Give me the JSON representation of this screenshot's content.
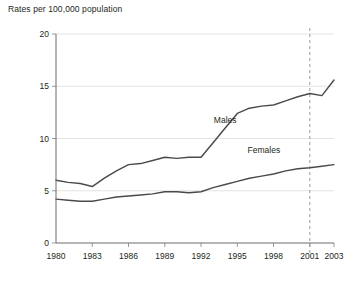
{
  "chart_data": {
    "type": "line",
    "title": "Rates per 100,000 population",
    "xlabel": "",
    "ylabel": "Rates per 100,000 population",
    "xlim": [
      1980,
      2003
    ],
    "ylim": [
      0,
      20
    ],
    "yticks": [
      "0",
      "5",
      "10",
      "15",
      "20"
    ],
    "ytick_values": [
      0,
      5,
      10,
      15,
      20
    ],
    "xticks": [
      "1980",
      "1983",
      "1986",
      "1989",
      "1992",
      "1995",
      "1998",
      "2001",
      "2003"
    ],
    "xtick_values": [
      1980,
      1983,
      1986,
      1989,
      1992,
      1995,
      1998,
      2001,
      2003
    ],
    "grid": true,
    "legend_position": "inline-annotation",
    "annotations": [
      {
        "text": "Males",
        "x": 1994,
        "y": 11.5
      },
      {
        "text": "Females",
        "x": 1997.2,
        "y": 8.6
      }
    ],
    "reference_line": {
      "x": 2001,
      "style": "dashed"
    },
    "x": [
      1980,
      1981,
      1982,
      1983,
      1984,
      1985,
      1986,
      1987,
      1988,
      1989,
      1990,
      1991,
      1992,
      1993,
      1994,
      1995,
      1996,
      1997,
      1998,
      1999,
      2000,
      2001,
      2002,
      2003
    ],
    "series": [
      {
        "name": "Males",
        "values": [
          6.0,
          5.8,
          5.7,
          5.4,
          6.2,
          6.9,
          7.5,
          7.6,
          7.9,
          8.2,
          8.1,
          8.2,
          8.2,
          9.6,
          11.0,
          12.4,
          12.9,
          13.1,
          13.2,
          13.6,
          14.0,
          14.3,
          14.1,
          15.6
        ]
      },
      {
        "name": "Females",
        "values": [
          4.2,
          4.1,
          4.0,
          4.0,
          4.2,
          4.4,
          4.5,
          4.6,
          4.7,
          4.9,
          4.9,
          4.8,
          4.9,
          5.3,
          5.6,
          5.9,
          6.2,
          6.4,
          6.6,
          6.9,
          7.1,
          7.2,
          7.35,
          7.5
        ]
      }
    ],
    "colors": {
      "line": "#4a4a4a",
      "grid": "#e3e3e3",
      "axis": "#6d6d6d",
      "text": "#231f20",
      "reference": "#9a9a9a"
    }
  }
}
